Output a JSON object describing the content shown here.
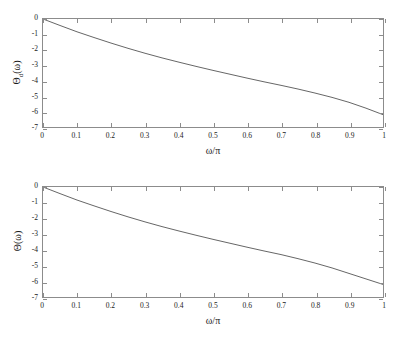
{
  "figure": {
    "background": "#ffffff",
    "axis_color": "#8c8c8c",
    "curve_color": "#555555"
  },
  "chart_data": [
    {
      "type": "line",
      "title": "",
      "xlabel": "ω/π",
      "ylabel": "Θ_d(ω)",
      "ylabel_base": "Θ",
      "ylabel_sub": "d",
      "ylabel_arg": "(ω)",
      "xlim": [
        0,
        1
      ],
      "ylim": [
        -7,
        0
      ],
      "grid": false,
      "legend": null,
      "xticks": [
        0,
        0.1,
        0.2,
        0.3,
        0.4,
        0.5,
        0.6,
        0.7,
        0.8,
        0.9,
        1
      ],
      "xticklabels": [
        "0",
        "0.1",
        "0.2",
        "0.3",
        "0.4",
        "0.5",
        "0.6",
        "0.7",
        "0.8",
        "0.9",
        "1"
      ],
      "yticks": [
        0,
        -1,
        -2,
        -3,
        -4,
        -5,
        -6,
        -7
      ],
      "yticklabels": [
        "0",
        "-1",
        "-2",
        "-3",
        "-4",
        "-5",
        "-6",
        "-7"
      ],
      "x": [
        0,
        0.05,
        0.1,
        0.15,
        0.2,
        0.25,
        0.3,
        0.35,
        0.4,
        0.45,
        0.5,
        0.55,
        0.6,
        0.65,
        0.7,
        0.75,
        0.8,
        0.85,
        0.9,
        0.95,
        1
      ],
      "y": [
        0,
        -0.42,
        -0.83,
        -1.2,
        -1.56,
        -1.9,
        -2.22,
        -2.52,
        -2.8,
        -3.07,
        -3.33,
        -3.58,
        -3.83,
        -4.07,
        -4.3,
        -4.54,
        -4.8,
        -5.08,
        -5.4,
        -5.78,
        -6.2
      ]
    },
    {
      "type": "line",
      "title": "",
      "xlabel": "ω/π",
      "ylabel": "Θ(ω)",
      "ylabel_base": "Θ",
      "ylabel_sub": "",
      "ylabel_arg": "(ω)",
      "xlim": [
        0,
        1
      ],
      "ylim": [
        -7,
        0
      ],
      "grid": false,
      "legend": null,
      "xticks": [
        0,
        0.1,
        0.2,
        0.3,
        0.4,
        0.5,
        0.6,
        0.7,
        0.8,
        0.9,
        1
      ],
      "xticklabels": [
        "0",
        "0.1",
        "0.2",
        "0.3",
        "0.4",
        "0.5",
        "0.6",
        "0.7",
        "0.8",
        "0.9",
        "1"
      ],
      "yticks": [
        0,
        -1,
        -2,
        -3,
        -4,
        -5,
        -6,
        -7
      ],
      "yticklabels": [
        "0",
        "-1",
        "-2",
        "-3",
        "-4",
        "-5",
        "-6",
        "-7"
      ],
      "x": [
        0,
        0.05,
        0.1,
        0.15,
        0.2,
        0.25,
        0.3,
        0.35,
        0.4,
        0.45,
        0.5,
        0.55,
        0.6,
        0.65,
        0.7,
        0.75,
        0.8,
        0.85,
        0.9,
        0.95,
        1
      ],
      "y": [
        0,
        -0.42,
        -0.83,
        -1.2,
        -1.56,
        -1.9,
        -2.22,
        -2.52,
        -2.8,
        -3.07,
        -3.33,
        -3.58,
        -3.83,
        -4.07,
        -4.3,
        -4.56,
        -4.84,
        -5.15,
        -5.5,
        -5.85,
        -6.2
      ]
    }
  ]
}
